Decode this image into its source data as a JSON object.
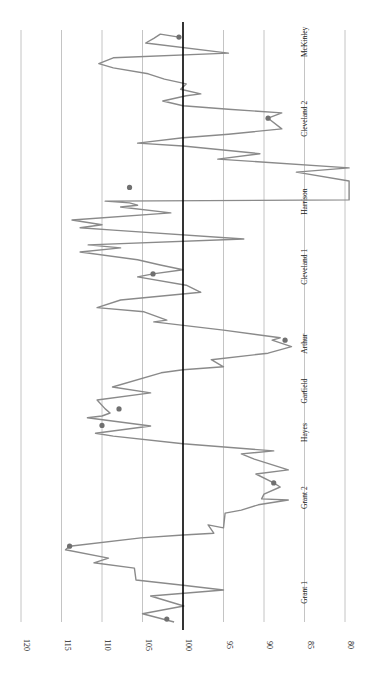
{
  "chart_data": {
    "type": "line",
    "orientation": "rotated-90-ccw",
    "title": "",
    "xlabel": "",
    "ylabel": "",
    "ylim": [
      80,
      120
    ],
    "yticks": [
      120,
      115,
      110,
      105,
      100,
      95,
      90,
      85,
      80
    ],
    "reference_line": 100,
    "grid": true,
    "legend": null,
    "period_labels": [
      "Grant 1",
      "Grant 2",
      "Hayes",
      "Garfield",
      "Arthur",
      "Cleveland 1",
      "Harrison",
      "Cleveland 2",
      "McKinley"
    ],
    "period_label_positions": [
      0.05,
      0.21,
      0.32,
      0.39,
      0.47,
      0.6,
      0.71,
      0.85,
      0.98
    ],
    "series": [
      {
        "name": "index",
        "points": [
          [
            0.0,
            101.1
          ],
          [
            0.014,
            105.0
          ],
          [
            0.027,
            99.9
          ],
          [
            0.044,
            104.0
          ],
          [
            0.054,
            95.0
          ],
          [
            0.062,
            100.0
          ],
          [
            0.071,
            105.8
          ],
          [
            0.091,
            106.0
          ],
          [
            0.1,
            111.0
          ],
          [
            0.108,
            109.2
          ],
          [
            0.122,
            114.5
          ],
          [
            0.128,
            114.0
          ],
          [
            0.142,
            105.2
          ],
          [
            0.147,
            100.0
          ],
          [
            0.15,
            96.2
          ],
          [
            0.164,
            96.9
          ],
          [
            0.159,
            95.0
          ],
          [
            0.184,
            94.8
          ],
          [
            0.189,
            92.8
          ],
          [
            0.198,
            90.7
          ],
          [
            0.206,
            87.0
          ],
          [
            0.208,
            90.3
          ],
          [
            0.216,
            90.0
          ],
          [
            0.228,
            88.0
          ],
          [
            0.235,
            88.8
          ],
          [
            0.25,
            91.0
          ],
          [
            0.257,
            87.0
          ],
          [
            0.275,
            91.2
          ],
          [
            0.284,
            92.8
          ],
          [
            0.289,
            88.8
          ],
          [
            0.301,
            100.0
          ],
          [
            0.314,
            108.6
          ],
          [
            0.319,
            110.8
          ],
          [
            0.331,
            104.0
          ],
          [
            0.345,
            111.8
          ],
          [
            0.348,
            110.0
          ],
          [
            0.353,
            109.0
          ],
          [
            0.36,
            109.6
          ],
          [
            0.375,
            110.6
          ],
          [
            0.387,
            104.0
          ],
          [
            0.397,
            108.7
          ],
          [
            0.421,
            102.7
          ],
          [
            0.426,
            100.0
          ],
          [
            0.431,
            95.0
          ],
          [
            0.443,
            96.5
          ],
          [
            0.454,
            89.5
          ],
          [
            0.465,
            86.6
          ],
          [
            0.476,
            89.0
          ],
          [
            0.48,
            88.0
          ],
          [
            0.493,
            95.0
          ],
          [
            0.507,
            103.6
          ],
          [
            0.51,
            102.0
          ],
          [
            0.524,
            104.8
          ],
          [
            0.531,
            110.6
          ],
          [
            0.544,
            107.7
          ],
          [
            0.557,
            97.8
          ],
          [
            0.569,
            99.6
          ],
          [
            0.583,
            105.6
          ],
          [
            0.588,
            103.7
          ],
          [
            0.595,
            100.0
          ],
          [
            0.603,
            102.8
          ],
          [
            0.612,
            105.6
          ],
          [
            0.625,
            112.7
          ],
          [
            0.632,
            107.7
          ],
          [
            0.637,
            111.7
          ],
          [
            0.647,
            92.5
          ],
          [
            0.662,
            108.6
          ],
          [
            0.666,
            112.7
          ],
          [
            0.671,
            110.0
          ],
          [
            0.679,
            113.7
          ],
          [
            0.691,
            101.5
          ],
          [
            0.701,
            107.7
          ],
          [
            0.704,
            105.6
          ],
          [
            0.708,
            106.6
          ],
          [
            0.711,
            109.6
          ],
          [
            0.713,
            79.5
          ],
          [
            0.745,
            79.5
          ],
          [
            0.76,
            86.0
          ],
          [
            0.767,
            79.5
          ],
          [
            0.782,
            95.7
          ],
          [
            0.791,
            90.5
          ],
          [
            0.804,
            100.0
          ],
          [
            0.809,
            105.6
          ],
          [
            0.818,
            100.0
          ],
          [
            0.824,
            94.4
          ],
          [
            0.833,
            87.8
          ],
          [
            0.851,
            89.5
          ],
          [
            0.86,
            87.8
          ],
          [
            0.866,
            94.4
          ],
          [
            0.872,
            100.0
          ],
          [
            0.88,
            102.5
          ],
          [
            0.889,
            99.6
          ],
          [
            0.892,
            97.8
          ],
          [
            0.9,
            100.3
          ],
          [
            0.909,
            99.6
          ],
          [
            0.917,
            102.3
          ],
          [
            0.926,
            104.3
          ],
          [
            0.936,
            108.6
          ],
          [
            0.943,
            110.4
          ],
          [
            0.953,
            108.6
          ],
          [
            0.961,
            94.4
          ],
          [
            0.978,
            104.6
          ],
          [
            0.986,
            103.6
          ],
          [
            0.993,
            102.8
          ],
          [
            0.988,
            100.5
          ]
        ]
      }
    ],
    "markers": [
      {
        "t": 0.005,
        "value": 102.0
      },
      {
        "t": 0.128,
        "value": 114.0
      },
      {
        "t": 0.235,
        "value": 88.8
      },
      {
        "t": 0.332,
        "value": 110.0
      },
      {
        "t": 0.36,
        "value": 107.9
      },
      {
        "t": 0.476,
        "value": 87.4
      },
      {
        "t": 0.588,
        "value": 103.7
      },
      {
        "t": 0.734,
        "value": 106.6
      },
      {
        "t": 0.851,
        "value": 89.5
      },
      {
        "t": 0.988,
        "value": 100.5
      }
    ]
  },
  "colors": {
    "series": "#8a8a8a",
    "marker": "#707070",
    "grid": "#b5b5b5",
    "reference": "#000000",
    "text": "#222222"
  }
}
